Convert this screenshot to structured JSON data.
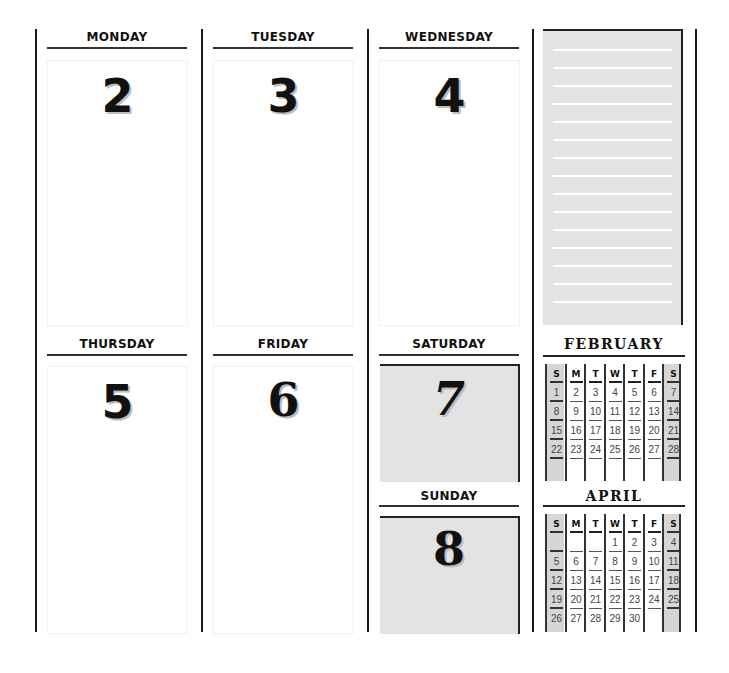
{
  "week": {
    "days": [
      {
        "name": "MONDAY",
        "date": "2",
        "weekend": false
      },
      {
        "name": "TUESDAY",
        "date": "3",
        "weekend": false
      },
      {
        "name": "WEDNESDAY",
        "date": "4",
        "weekend": false
      },
      {
        "name": "THURSDAY",
        "date": "5",
        "weekend": false
      },
      {
        "name": "FRIDAY",
        "date": "6",
        "weekend": false
      },
      {
        "name": "SATURDAY",
        "date": "7",
        "weekend": true
      },
      {
        "name": "SUNDAY",
        "date": "8",
        "weekend": true
      }
    ]
  },
  "notes": {
    "line_count": 15
  },
  "mini_calendars": [
    {
      "month": "february",
      "weekday_headers": [
        "S",
        "M",
        "T",
        "W",
        "T",
        "F",
        "S"
      ],
      "weeks": [
        [
          "1",
          "2",
          "3",
          "4",
          "5",
          "6",
          "7"
        ],
        [
          "8",
          "9",
          "10",
          "11",
          "12",
          "13",
          "14"
        ],
        [
          "15",
          "16",
          "17",
          "18",
          "19",
          "20",
          "21"
        ],
        [
          "22",
          "23",
          "24",
          "25",
          "26",
          "27",
          "28"
        ]
      ]
    },
    {
      "month": "april",
      "weekday_headers": [
        "S",
        "M",
        "T",
        "W",
        "T",
        "F",
        "S"
      ],
      "weeks": [
        [
          "",
          "",
          "",
          "1",
          "2",
          "3",
          "4"
        ],
        [
          "5",
          "6",
          "7",
          "8",
          "9",
          "10",
          "11"
        ],
        [
          "12",
          "13",
          "14",
          "15",
          "16",
          "17",
          "18"
        ],
        [
          "19",
          "20",
          "21",
          "22",
          "23",
          "24",
          "25"
        ],
        [
          "26",
          "27",
          "28",
          "29",
          "30",
          "",
          ""
        ]
      ]
    }
  ],
  "colors": {
    "ink": "#111111",
    "weekend_fill": "#e3e3e3",
    "mini_weekend_fill": "#d6d6d6"
  }
}
